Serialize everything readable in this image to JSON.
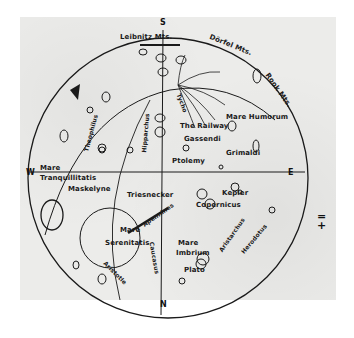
{
  "map": {
    "title": "Lunar map (hand-drawn)",
    "directions": {
      "south": "S",
      "west": "W",
      "east": "E",
      "north": "N"
    },
    "mountains": [
      {
        "label": "Leibnitz Mts."
      },
      {
        "label": "Dörfel Mts."
      },
      {
        "label": "Rook Mts."
      },
      {
        "label": "Apennines"
      },
      {
        "label": "Caucasus"
      }
    ],
    "seas": [
      {
        "label_line1": "Mare",
        "label_line2": "Humorum"
      },
      {
        "label_line1": "Mare",
        "label_line2": "Tranquillitatis"
      },
      {
        "label_line1": "Mare",
        "label_line2": "Serenitatis"
      },
      {
        "label_line1": "Mare",
        "label_line2": "Imbrium"
      }
    ],
    "craters": [
      {
        "label": "Tycho"
      },
      {
        "label": "The Railway"
      },
      {
        "label": "Gassendi"
      },
      {
        "label": "Grimaldi"
      },
      {
        "label": "Ptolemy"
      },
      {
        "label": "Hipparchus"
      },
      {
        "label": "Theophilus"
      },
      {
        "label": "Maskelyne"
      },
      {
        "label": "Triesnecker"
      },
      {
        "label": "Kepler"
      },
      {
        "label": "Copernicus"
      },
      {
        "label": "Aristarchus"
      },
      {
        "label": "Herodotus"
      },
      {
        "label": "Aristotle"
      },
      {
        "label": "Plato"
      }
    ],
    "side_mark": {
      "top": "=",
      "bottom": "+"
    }
  },
  "colors": {
    "paper": "#ececea",
    "ink": "#1a1a1a"
  }
}
